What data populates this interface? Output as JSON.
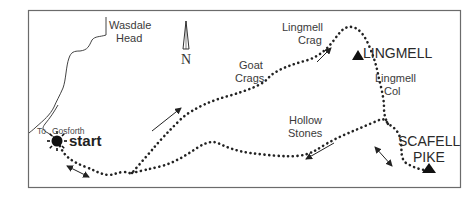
{
  "map": {
    "title": "Wasdale Head to Scafell Pike route",
    "labels": {
      "wasdale_line1": "Wasdale",
      "wasdale_line2": "Head",
      "to_gosforth_to": "To",
      "to_gosforth_place": "Gosforth",
      "start": "start",
      "north": "N",
      "goat_line1": "Goat",
      "goat_line2": "Crags",
      "lingmell_crag_line1": "Lingmell",
      "lingmell_crag_line2": "Crag",
      "lingmell_peak": "LINGMELL",
      "lingmell_col_line1": "Lingmell",
      "lingmell_col_line2": "Col",
      "hollow_line1": "Hollow",
      "hollow_line2": "Stones",
      "scafell_line1": "SCAFELL",
      "scafell_line2": "PIKE"
    },
    "peaks": [
      "LINGMELL",
      "SCAFELL PIKE"
    ],
    "waypoints": [
      "Wasdale Head",
      "start",
      "Goat Crags",
      "Lingmell Crag",
      "LINGMELL",
      "Lingmell Col",
      "Hollow Stones",
      "SCAFELL PIKE"
    ],
    "colors": {
      "frame": "#6b6b6b",
      "route": "#222222",
      "text": "#3a3a3a"
    }
  }
}
